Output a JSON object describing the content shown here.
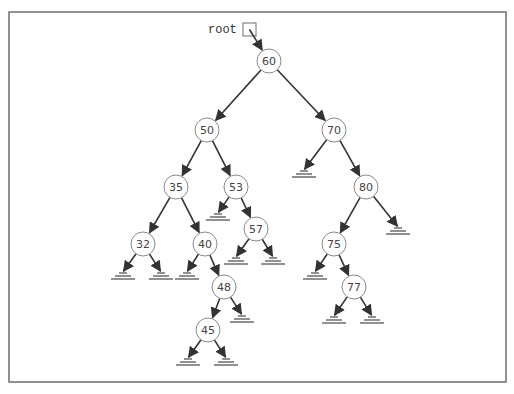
{
  "diagram": {
    "type": "binary-search-tree",
    "root_label": "root",
    "frame": {
      "x": 9,
      "y": 12,
      "width": 497,
      "height": 370
    },
    "root_pointer_box": {
      "x": 243,
      "y": 23,
      "size": 13
    },
    "node_radius": 12,
    "nodes": [
      {
        "id": "n60",
        "value": "60",
        "x": 269,
        "y": 61
      },
      {
        "id": "n50",
        "value": "50",
        "x": 207,
        "y": 130
      },
      {
        "id": "n70",
        "value": "70",
        "x": 334,
        "y": 130
      },
      {
        "id": "n35",
        "value": "35",
        "x": 176,
        "y": 187
      },
      {
        "id": "n53",
        "value": "53",
        "x": 236,
        "y": 187
      },
      {
        "id": "n80",
        "value": "80",
        "x": 366,
        "y": 187
      },
      {
        "id": "n32",
        "value": "32",
        "x": 143,
        "y": 244
      },
      {
        "id": "n40",
        "value": "40",
        "x": 205,
        "y": 244
      },
      {
        "id": "n57",
        "value": "57",
        "x": 256,
        "y": 229
      },
      {
        "id": "n75",
        "value": "75",
        "x": 334,
        "y": 244
      },
      {
        "id": "n48",
        "value": "48",
        "x": 224,
        "y": 287
      },
      {
        "id": "n77",
        "value": "77",
        "x": 354,
        "y": 287
      },
      {
        "id": "n45",
        "value": "45",
        "x": 208,
        "y": 330
      }
    ],
    "edges": [
      {
        "from": "n60",
        "to": "n50"
      },
      {
        "from": "n60",
        "to": "n70"
      },
      {
        "from": "n50",
        "to": "n35"
      },
      {
        "from": "n50",
        "to": "n53"
      },
      {
        "from": "n35",
        "to": "n32"
      },
      {
        "from": "n35",
        "to": "n40"
      },
      {
        "from": "n53",
        "to": "n57"
      },
      {
        "from": "n40",
        "to": "n48"
      },
      {
        "from": "n48",
        "to": "n45"
      },
      {
        "from": "n70",
        "to": "n80"
      },
      {
        "from": "n80",
        "to": "n75"
      },
      {
        "from": "n75",
        "to": "n77"
      }
    ],
    "null_links": [
      {
        "from": "n70",
        "x": 304,
        "y": 176
      },
      {
        "from": "n53",
        "x": 218,
        "y": 219
      },
      {
        "from": "n80",
        "x": 398,
        "y": 233
      },
      {
        "from": "n32",
        "x": 123,
        "y": 278
      },
      {
        "from": "n32",
        "x": 161,
        "y": 278
      },
      {
        "from": "n40",
        "x": 187,
        "y": 278
      },
      {
        "from": "n57",
        "x": 236,
        "y": 263
      },
      {
        "from": "n57",
        "x": 273,
        "y": 263
      },
      {
        "from": "n75",
        "x": 315,
        "y": 278
      },
      {
        "from": "n48",
        "x": 242,
        "y": 321
      },
      {
        "from": "n77",
        "x": 334,
        "y": 322
      },
      {
        "from": "n77",
        "x": 372,
        "y": 322
      },
      {
        "from": "n45",
        "x": 188,
        "y": 364
      },
      {
        "from": "n45",
        "x": 226,
        "y": 364
      }
    ]
  }
}
